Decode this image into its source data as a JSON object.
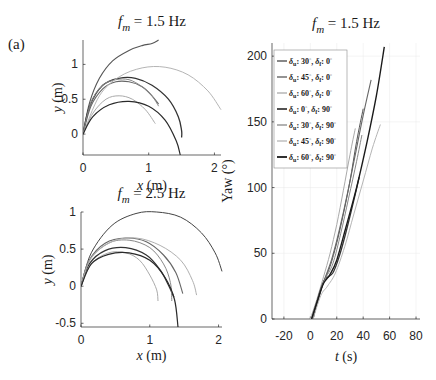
{
  "panel_label": "(a)",
  "chart_data": [
    {
      "type": "line",
      "id": "traj_1_5",
      "title": "f_m = 1.5 Hz",
      "title_parts": {
        "f": "f",
        "sub": "m",
        "rest": " = 1.5 Hz"
      },
      "xlabel": "x (m)",
      "ylabel": "y (m)",
      "xlim": [
        0,
        2.1
      ],
      "ylim": [
        -0.3,
        1.35
      ],
      "xticks": [
        0,
        1,
        2
      ],
      "yticks": [
        0,
        0.5,
        1
      ],
      "ytick_labels": [
        "0",
        "0.5",
        "1"
      ],
      "grid": false,
      "series": [
        {
          "name": "δu:30°, δf:0°",
          "color": "#555555",
          "width": 1.1,
          "points": [
            [
              0,
              0
            ],
            [
              0.1,
              0.45
            ],
            [
              0.25,
              0.8
            ],
            [
              0.45,
              1.05
            ],
            [
              0.7,
              1.2
            ],
            [
              0.9,
              1.27
            ],
            [
              1.05,
              1.3
            ],
            [
              1.15,
              1.35
            ]
          ]
        },
        {
          "name": "δu:45°, δf:0°",
          "color": "#666666",
          "width": 1.1,
          "points": [
            [
              0,
              0
            ],
            [
              0.12,
              0.4
            ],
            [
              0.3,
              0.65
            ],
            [
              0.5,
              0.75
            ],
            [
              0.7,
              0.75
            ],
            [
              0.9,
              0.68
            ],
            [
              1.05,
              0.55
            ],
            [
              1.15,
              0.43
            ]
          ]
        },
        {
          "name": "δu:60°, δf:0°",
          "color": "#aaaaaa",
          "width": 1.0,
          "points": [
            [
              0,
              0
            ],
            [
              0.15,
              0.3
            ],
            [
              0.35,
              0.5
            ],
            [
              0.55,
              0.55
            ],
            [
              0.75,
              0.5
            ],
            [
              0.95,
              0.35
            ],
            [
              1.1,
              0.15
            ]
          ]
        },
        {
          "name": "δu:0°, δf:90°",
          "color": "#333333",
          "width": 1.3,
          "points": [
            [
              0,
              0
            ],
            [
              0.1,
              0.4
            ],
            [
              0.3,
              0.7
            ],
            [
              0.55,
              0.8
            ],
            [
              0.8,
              0.8
            ],
            [
              1.05,
              0.7
            ],
            [
              1.3,
              0.5
            ],
            [
              1.45,
              0.25
            ],
            [
              1.5,
              0.05
            ],
            [
              1.5,
              -0.05
            ]
          ]
        },
        {
          "name": "δu:30°, δf:90°",
          "color": "#888888",
          "width": 1.0,
          "points": [
            [
              0,
              0
            ],
            [
              0.12,
              0.45
            ],
            [
              0.3,
              0.7
            ],
            [
              0.5,
              0.78
            ],
            [
              0.7,
              0.78
            ],
            [
              0.9,
              0.68
            ],
            [
              1.05,
              0.55
            ],
            [
              1.15,
              0.4
            ]
          ]
        },
        {
          "name": "δu:45°, δf:90°",
          "color": "#b5b5b5",
          "width": 1.0,
          "points": [
            [
              0,
              0
            ],
            [
              0.25,
              0.55
            ],
            [
              0.55,
              0.82
            ],
            [
              0.9,
              0.95
            ],
            [
              1.25,
              0.96
            ],
            [
              1.6,
              0.85
            ],
            [
              1.9,
              0.62
            ],
            [
              2.1,
              0.35
            ]
          ]
        },
        {
          "name": "δu:60°, δf:90°",
          "color": "#2a2a2a",
          "width": 1.2,
          "points": [
            [
              0,
              0
            ],
            [
              0.15,
              0.25
            ],
            [
              0.4,
              0.42
            ],
            [
              0.7,
              0.47
            ],
            [
              1.0,
              0.4
            ],
            [
              1.25,
              0.2
            ],
            [
              1.42,
              -0.1
            ],
            [
              1.48,
              -0.3
            ]
          ]
        }
      ]
    },
    {
      "type": "line",
      "id": "traj_2_5",
      "title": "f_m = 2.5 Hz",
      "title_parts": {
        "f": "f",
        "sub": "m",
        "rest": " = 2.5 Hz"
      },
      "xlabel": "x (m)",
      "ylabel": "y (m)",
      "xlim": [
        0,
        2.05
      ],
      "ylim": [
        -0.55,
        1.0
      ],
      "xticks": [
        0,
        1,
        2
      ],
      "yticks": [
        -0.5,
        0,
        0.5,
        1
      ],
      "ytick_labels": [
        "-0.5",
        "0",
        "0.5",
        "1"
      ],
      "grid": false,
      "series": [
        {
          "name": "δu:30°, δf:0°",
          "color": "#444444",
          "width": 1.0,
          "points": [
            [
              0,
              0
            ],
            [
              0.15,
              0.45
            ],
            [
              0.45,
              0.82
            ],
            [
              0.8,
              0.98
            ],
            [
              1.1,
              1.0
            ],
            [
              1.45,
              0.93
            ],
            [
              1.75,
              0.72
            ],
            [
              1.95,
              0.45
            ],
            [
              2.05,
              0.2
            ]
          ]
        },
        {
          "name": "δu:45°, δf:0°",
          "color": "#666666",
          "width": 1.1,
          "points": [
            [
              0,
              0
            ],
            [
              0.12,
              0.35
            ],
            [
              0.35,
              0.58
            ],
            [
              0.65,
              0.65
            ],
            [
              0.95,
              0.6
            ],
            [
              1.2,
              0.42
            ],
            [
              1.38,
              0.18
            ],
            [
              1.48,
              -0.1
            ]
          ]
        },
        {
          "name": "δu:60°, δf:0°",
          "color": "#aaaaaa",
          "width": 1.0,
          "points": [
            [
              0,
              0
            ],
            [
              0.15,
              0.3
            ],
            [
              0.4,
              0.45
            ],
            [
              0.65,
              0.45
            ],
            [
              0.85,
              0.35
            ],
            [
              1.0,
              0.15
            ],
            [
              1.1,
              -0.05
            ],
            [
              1.12,
              -0.2
            ]
          ]
        },
        {
          "name": "δu:0°, δf:90°",
          "color": "#333333",
          "width": 1.3,
          "points": [
            [
              0,
              0
            ],
            [
              0.12,
              0.3
            ],
            [
              0.35,
              0.48
            ],
            [
              0.65,
              0.52
            ],
            [
              0.95,
              0.42
            ],
            [
              1.15,
              0.22
            ],
            [
              1.28,
              0.0
            ],
            [
              1.35,
              -0.15
            ]
          ]
        },
        {
          "name": "δu:30°, δf:90°",
          "color": "#888888",
          "width": 1.0,
          "points": [
            [
              0,
              0
            ],
            [
              0.12,
              0.35
            ],
            [
              0.4,
              0.58
            ],
            [
              0.7,
              0.62
            ],
            [
              1.0,
              0.52
            ],
            [
              1.2,
              0.3
            ],
            [
              1.3,
              0.05
            ],
            [
              1.32,
              -0.2
            ]
          ]
        },
        {
          "name": "δu:45°, δf:90°",
          "color": "#b0b0b0",
          "width": 1.0,
          "points": [
            [
              0,
              0
            ],
            [
              0.15,
              0.38
            ],
            [
              0.45,
              0.6
            ],
            [
              0.8,
              0.65
            ],
            [
              1.15,
              0.55
            ],
            [
              1.45,
              0.35
            ],
            [
              1.62,
              0.08
            ],
            [
              1.68,
              -0.12
            ]
          ]
        },
        {
          "name": "δu:60°, δf:90°",
          "color": "#2a2a2a",
          "width": 1.2,
          "points": [
            [
              0,
              0
            ],
            [
              0.15,
              0.3
            ],
            [
              0.4,
              0.43
            ],
            [
              0.7,
              0.45
            ],
            [
              1.0,
              0.35
            ],
            [
              1.22,
              0.12
            ],
            [
              1.36,
              -0.18
            ],
            [
              1.41,
              -0.55
            ]
          ]
        }
      ]
    },
    {
      "type": "line",
      "id": "yaw_1_5",
      "title": "f_m = 1.5 Hz",
      "title_parts": {
        "f": "f",
        "sub": "m",
        "rest": " = 1.5 Hz"
      },
      "xlabel": "t (s)",
      "ylabel": "Yaw (°)",
      "xlim": [
        -29,
        83
      ],
      "ylim": [
        0,
        210
      ],
      "xticks": [
        -20,
        0,
        20,
        40,
        60,
        80
      ],
      "yticks": [
        0,
        50,
        100,
        150,
        200
      ],
      "ytick_labels": [
        "0",
        "50",
        "100",
        "150",
        "200"
      ],
      "grid": true,
      "legend": {
        "position": "upper left",
        "entries": [
          {
            "u": "30",
            "f": "0",
            "color": "#555555",
            "width": 1.1
          },
          {
            "u": "45",
            "f": "0",
            "color": "#666666",
            "width": 1.1
          },
          {
            "u": "60",
            "f": "0",
            "color": "#aaaaaa",
            "width": 1.0
          },
          {
            "u": "0",
            "f": "90",
            "color": "#333333",
            "width": 1.4
          },
          {
            "u": "30",
            "f": "90",
            "color": "#888888",
            "width": 1.0
          },
          {
            "u": "45",
            "f": "90",
            "color": "#b5b5b5",
            "width": 1.0
          },
          {
            "u": "60",
            "f": "90",
            "color": "#1a1a1a",
            "width": 1.5
          }
        ]
      },
      "series": [
        {
          "name": "δu:30°, δf:0°",
          "color": "#555555",
          "width": 1.0,
          "points": [
            [
              1,
              0
            ],
            [
              6,
              15
            ],
            [
              10,
              28
            ],
            [
              15,
              40
            ],
            [
              20,
              58
            ],
            [
              25,
              80
            ],
            [
              30,
              105
            ],
            [
              35,
              135
            ],
            [
              40,
              160
            ]
          ]
        },
        {
          "name": "δu:45°, δf:0°",
          "color": "#666666",
          "width": 1.1,
          "points": [
            [
              1,
              0
            ],
            [
              6,
              15
            ],
            [
              10,
              28
            ],
            [
              16,
              45
            ],
            [
              22,
              68
            ],
            [
              28,
              95
            ],
            [
              34,
              125
            ],
            [
              40,
              155
            ],
            [
              46,
              182
            ]
          ]
        },
        {
          "name": "δu:60°, δf:0°",
          "color": "#aaaaaa",
          "width": 1.0,
          "points": [
            [
              0,
              0
            ],
            [
              5,
              15
            ],
            [
              10,
              32
            ],
            [
              15,
              50
            ],
            [
              20,
              72
            ],
            [
              25,
              98
            ],
            [
              30,
              125
            ],
            [
              34,
              145
            ]
          ]
        },
        {
          "name": "δu:0°, δf:90°",
          "color": "#333333",
          "width": 1.3,
          "points": [
            [
              2,
              0
            ],
            [
              7,
              20
            ],
            [
              11,
              30
            ],
            [
              17,
              35
            ],
            [
              22,
              48
            ],
            [
              28,
              70
            ],
            [
              34,
              95
            ],
            [
              37,
              108
            ]
          ]
        },
        {
          "name": "δu:30°, δf:90°",
          "color": "#888888",
          "width": 1.0,
          "points": [
            [
              1,
              0
            ],
            [
              6,
              17
            ],
            [
              11,
              30
            ],
            [
              17,
              42
            ],
            [
              23,
              65
            ],
            [
              29,
              92
            ],
            [
              35,
              120
            ],
            [
              39,
              140
            ]
          ]
        },
        {
          "name": "δu:45°, δf:90°",
          "color": "#b5b5b5",
          "width": 1.0,
          "points": [
            [
              2,
              0
            ],
            [
              8,
              18
            ],
            [
              13,
              25
            ],
            [
              19,
              35
            ],
            [
              26,
              55
            ],
            [
              33,
              80
            ],
            [
              40,
              105
            ],
            [
              47,
              130
            ],
            [
              53,
              148
            ]
          ]
        },
        {
          "name": "δu:60°, δf:90°",
          "color": "#1a1a1a",
          "width": 1.4,
          "points": [
            [
              1,
              0
            ],
            [
              6,
              16
            ],
            [
              10,
              27
            ],
            [
              15,
              34
            ],
            [
              20,
              45
            ],
            [
              27,
              70
            ],
            [
              35,
              100
            ],
            [
              43,
              135
            ],
            [
              50,
              170
            ],
            [
              56,
              207
            ]
          ]
        }
      ]
    }
  ]
}
